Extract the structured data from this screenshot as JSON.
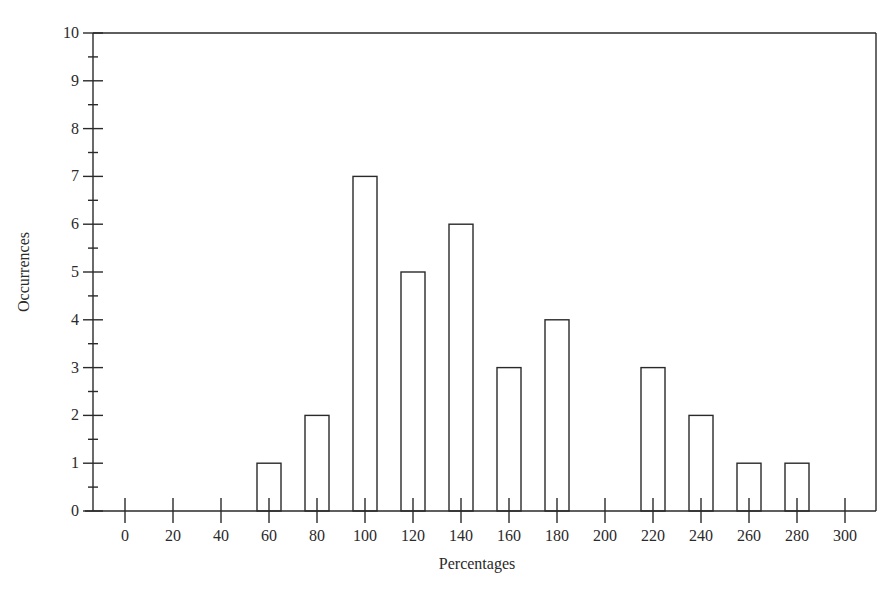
{
  "chart_data": {
    "type": "bar",
    "title": "",
    "xlabel": "Percentages",
    "ylabel": "Occurrences",
    "categories": [
      0,
      20,
      40,
      60,
      80,
      100,
      120,
      140,
      160,
      180,
      200,
      220,
      240,
      260,
      280,
      300
    ],
    "values": [
      0,
      0,
      0,
      1,
      2,
      7,
      5,
      6,
      3,
      4,
      0,
      3,
      2,
      1,
      1,
      0
    ],
    "xlim": [
      -13,
      327
    ],
    "ylim": [
      0,
      10
    ],
    "y_ticks": [
      0,
      1,
      2,
      3,
      4,
      5,
      6,
      7,
      8,
      9,
      10
    ],
    "y_minor_step": 0.5,
    "grid": false,
    "legend": null,
    "bar_fill": "#ffffff",
    "bar_stroke": "#2a2a2a",
    "axis_color": "#2a2a2a",
    "frame": "box (top and right border drawn)"
  }
}
